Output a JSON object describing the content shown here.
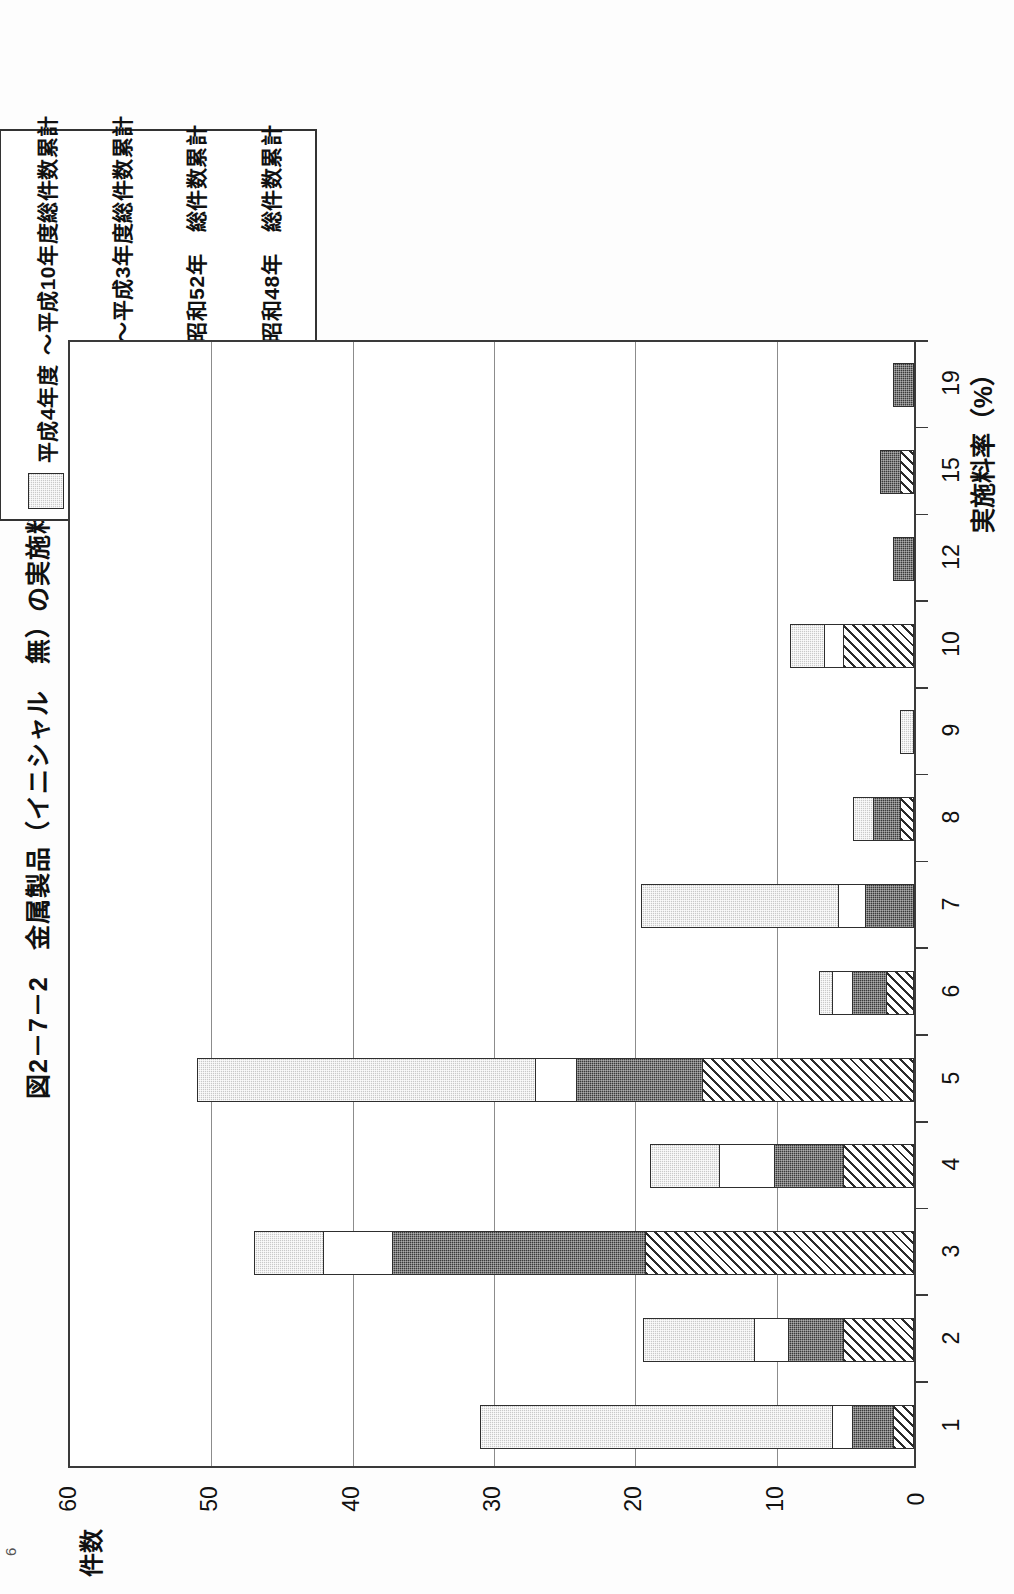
{
  "figure": {
    "title": "図2－7－2　金属製品（イニシャル　無）の実施料率別契約件数",
    "page_number": "6"
  },
  "legend": {
    "items": [
      {
        "swatch": "light-gray-dotted",
        "label": "平成4年度\n～平成10年度総件数累計",
        "line1": "平成4年度",
        "line2": "～平成10年度総件数累計"
      },
      {
        "swatch": "white",
        "label": "昭和63年度\n～平成3年度総件数累計",
        "line1": "昭和63年度",
        "line2": "～平成3年度総件数累計"
      },
      {
        "swatch": "dark-dotted",
        "label": "昭和49年\n～昭和52年　総件数累計",
        "line1": "昭和49年",
        "line2": "～昭和52年　総件数累計"
      },
      {
        "swatch": "diagonal-hatch",
        "label": "昭和43年\n～昭和48年　総件数累計",
        "line1": "昭和43年",
        "line2": "～昭和48年　総件数累計"
      }
    ]
  },
  "axes": {
    "category_axis_title": "実施料率（%）",
    "value_axis_title": "件数",
    "value_ticks": [
      "60",
      "50",
      "40",
      "30",
      "20",
      "10",
      "0"
    ],
    "category_ticks": [
      "1",
      "2",
      "3",
      "4",
      "5",
      "6",
      "7",
      "8",
      "9",
      "10",
      "12",
      "15",
      "19"
    ]
  },
  "colors": {
    "light_gray": "#c9c9c9",
    "white": "#ffffff",
    "dark_gray": "#3a3a3a",
    "hatch_line": "#2b2b2b",
    "axis": "#3a3a3a",
    "grid": "#8c8c8c"
  },
  "chart_data": {
    "type": "bar",
    "orientation": "horizontal-stacked",
    "title": "図2－7－2　金属製品（イニシャル　無）の実施料率別契約件数",
    "xlabel": "実施料率（%）",
    "ylabel": "件数",
    "ylim": [
      0,
      60
    ],
    "grid": true,
    "legend_position": "top-left",
    "categories": [
      "1",
      "2",
      "3",
      "4",
      "5",
      "6",
      "7",
      "8",
      "9",
      "10",
      "12",
      "15",
      "19"
    ],
    "series": [
      {
        "name": "昭和43年～昭和48年　総件数累計",
        "swatch": "diagonal-hatch",
        "values": [
          1.5,
          5,
          19,
          5,
          15,
          2,
          0,
          1,
          0,
          5,
          0,
          1,
          0
        ]
      },
      {
        "name": "昭和49年～昭和52年　総件数累計",
        "swatch": "dark-dotted",
        "values": [
          3,
          4,
          18,
          5,
          9,
          2.5,
          3.5,
          2,
          0,
          0,
          1.5,
          1.5,
          1.5
        ]
      },
      {
        "name": "昭和63年度～平成3年度総件数累計",
        "swatch": "white",
        "values": [
          1.5,
          2.5,
          5,
          4,
          3,
          1.5,
          2,
          0,
          0,
          1.5,
          0,
          0,
          0
        ]
      },
      {
        "name": "平成4年度～平成10年度総件数累計",
        "swatch": "light-gray-dotted",
        "values": [
          25,
          8,
          5,
          5,
          24,
          1,
          14,
          1.5,
          1,
          2.5,
          0,
          0,
          0
        ]
      }
    ],
    "totals": [
      31,
      19.5,
      47,
      19,
      51,
      7,
      19.5,
      4.5,
      1,
      9,
      1.5,
      2.5,
      1.5
    ]
  }
}
